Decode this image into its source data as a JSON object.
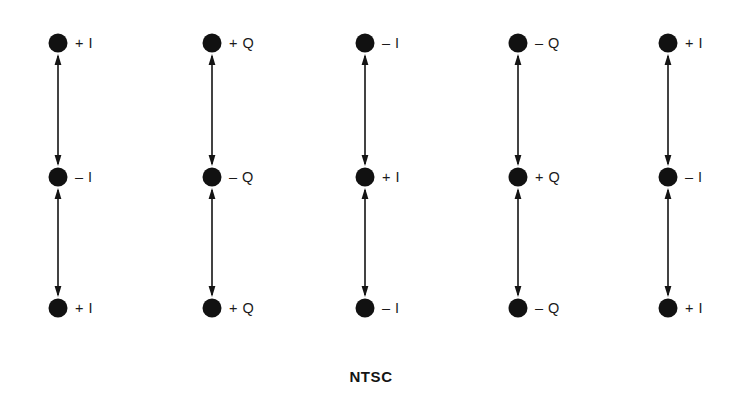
{
  "figure": {
    "caption": "NTSC",
    "caption_y": 368,
    "width": 742,
    "height": 404,
    "dot_color": "#111111",
    "line_color": "#141414",
    "text_color": "#1a1a1a",
    "background": "#ffffff",
    "row_y": [
      43,
      177,
      308
    ],
    "columns": [
      {
        "name": "column-1",
        "x": 58,
        "nodes": [
          {
            "label": "+ I"
          },
          {
            "label": "– I"
          },
          {
            "label": "+ I"
          }
        ]
      },
      {
        "name": "column-2",
        "x": 212,
        "nodes": [
          {
            "label": "+ Q"
          },
          {
            "label": "– Q"
          },
          {
            "label": "+ Q"
          }
        ]
      },
      {
        "name": "column-3",
        "x": 365,
        "nodes": [
          {
            "label": "– I"
          },
          {
            "label": "+ I"
          },
          {
            "label": "– I"
          }
        ]
      },
      {
        "name": "column-4",
        "x": 518,
        "nodes": [
          {
            "label": "– Q"
          },
          {
            "label": "+ Q"
          },
          {
            "label": "– Q"
          }
        ]
      },
      {
        "name": "column-5",
        "x": 668,
        "nodes": [
          {
            "label": "+ I"
          },
          {
            "label": "– I"
          },
          {
            "label": "+ I"
          }
        ]
      }
    ]
  },
  "chart_data": {
    "type": "diagram",
    "title": "NTSC",
    "rows": 3,
    "columns": 5,
    "labels_by_row": [
      [
        "+ I",
        "+ Q",
        "– I",
        "– Q",
        "+ I"
      ],
      [
        "– I",
        "– Q",
        "+ I",
        "+ Q",
        "– I"
      ],
      [
        "+ I",
        "+ Q",
        "– I",
        "– Q",
        "+ I"
      ]
    ],
    "labels_by_column": [
      [
        "+ I",
        "– I",
        "+ I"
      ],
      [
        "+ Q",
        "– Q",
        "+ Q"
      ],
      [
        "– I",
        "+ I",
        "– I"
      ],
      [
        "– Q",
        "+ Q",
        "– Q"
      ],
      [
        "+ I",
        "– I",
        "+ I"
      ]
    ],
    "connector_style": "double-headed-arrow",
    "xlabel": "",
    "ylabel": ""
  }
}
